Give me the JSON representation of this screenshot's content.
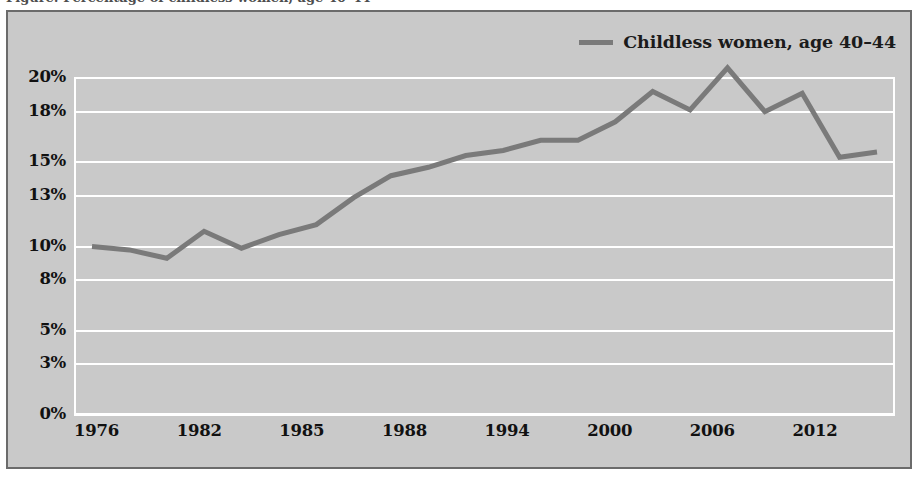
{
  "figure": {
    "cut_caption_text": "Figure: Percentage of childless women, age 40–44",
    "frame_bg": "#c9c9c9",
    "frame_border": "#6b6b6b",
    "gridline_color": "#ffffff",
    "series_color": "#7a7a7a"
  },
  "legend": {
    "position": "top-right",
    "entries": [
      {
        "label": "Childless women, age 40–44",
        "color": "#7a7a7a",
        "marker": "line-swatch"
      }
    ]
  },
  "chart_data": {
    "type": "line",
    "title": "",
    "subtitle": "",
    "xlabel": "",
    "ylabel": "",
    "grid": true,
    "legend_position": "top-right",
    "ylim": [
      0,
      20.6
    ],
    "ytick_values": [
      20,
      18,
      15,
      13,
      10,
      8,
      5,
      3,
      0
    ],
    "ytick_labels": [
      "20%",
      "18%",
      "15%",
      "13%",
      "10%",
      "8%",
      "5%",
      "3%",
      "0%"
    ],
    "xtick_labels": [
      "1976",
      "1982",
      "1985",
      "1988",
      "1994",
      "2000",
      "2006",
      "2012"
    ],
    "series": [
      {
        "name": "Childless women, age 40–44",
        "color": "#7a7a7a",
        "x": [
          "1976",
          "1977",
          "1978",
          "1979",
          "1980",
          "1981",
          "1982",
          "1983",
          "1984",
          "1985",
          "1986",
          "1987",
          "1988",
          "1989",
          "1990",
          "1991",
          "1992",
          "1993",
          "1994",
          "1995",
          "1996",
          "1997"
        ],
        "values": [
          10.0,
          9.8,
          9.3,
          10.9,
          9.9,
          10.7,
          11.3,
          12.9,
          14.2,
          14.7,
          15.4,
          15.7,
          16.3,
          16.3,
          17.4,
          19.2,
          18.1,
          20.6,
          18.0,
          19.1,
          15.3,
          15.6
        ],
        "x_labeled": [
          "1976",
          "1982",
          "1985",
          "1988",
          "1994",
          "2000",
          "2006",
          "2012"
        ]
      }
    ]
  }
}
